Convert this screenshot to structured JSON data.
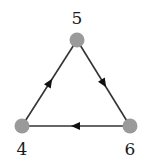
{
  "diagram": {
    "type": "directed-graph",
    "colors": {
      "node_fill": "#9a9a9a",
      "edge_stroke": "#333333",
      "arrow_fill": "#111111",
      "label_color": "#1a1a1a",
      "background": "#ffffff"
    },
    "nodes": [
      {
        "id": "5",
        "label": "5",
        "x": 77,
        "y": 40,
        "label_x": 77,
        "label_y": 24
      },
      {
        "id": "4",
        "label": "4",
        "x": 22,
        "y": 126,
        "label_x": 22,
        "label_y": 155
      },
      {
        "id": "6",
        "label": "6",
        "x": 130,
        "y": 126,
        "label_x": 130,
        "label_y": 155
      }
    ],
    "edges": [
      {
        "from": "5",
        "to": "6",
        "arrow_position": 0.5
      },
      {
        "from": "6",
        "to": "4",
        "arrow_position": 0.5
      },
      {
        "from": "4",
        "to": "5",
        "arrow_position": 0.5
      }
    ]
  }
}
